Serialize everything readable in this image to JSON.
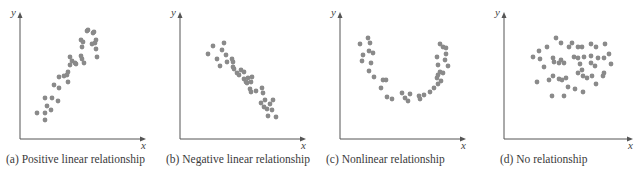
{
  "figure": {
    "panels": [
      {
        "id": "a",
        "caption": "(a) Positive linear relationship",
        "xlabel": "x",
        "ylabel": "y"
      },
      {
        "id": "b",
        "caption": "(b) Negative linear relationship",
        "xlabel": "x",
        "ylabel": "y"
      },
      {
        "id": "c",
        "caption": "(c) Nonlinear relationship",
        "xlabel": "x",
        "ylabel": "y"
      },
      {
        "id": "d",
        "caption": "(d) No relationship",
        "xlabel": "x",
        "ylabel": "y"
      }
    ],
    "colors": {
      "axis": "#555555",
      "dot": "#8a8a8a"
    }
  },
  "chart_data": [
    {
      "type": "scatter",
      "title": "(a) Positive linear relationship",
      "xlabel": "x",
      "ylabel": "y",
      "grid": false,
      "points": [
        [
          37,
          113
        ],
        [
          45,
          113
        ],
        [
          45,
          120
        ],
        [
          51,
          110
        ],
        [
          47,
          106
        ],
        [
          45,
          98
        ],
        [
          52,
          98
        ],
        [
          58,
          101
        ],
        [
          54,
          85
        ],
        [
          59,
          88
        ],
        [
          59,
          77
        ],
        [
          64,
          76
        ],
        [
          67,
          75
        ],
        [
          68,
          72
        ],
        [
          68,
          82
        ],
        [
          70,
          65
        ],
        [
          72,
          61
        ],
        [
          70,
          57
        ],
        [
          75,
          63
        ],
        [
          76,
          64
        ],
        [
          82,
          59
        ],
        [
          84,
          63
        ],
        [
          81,
          56
        ],
        [
          82,
          47
        ],
        [
          83,
          42
        ],
        [
          81,
          40
        ],
        [
          95,
          43
        ],
        [
          96,
          49
        ],
        [
          97,
          57
        ],
        [
          96,
          40
        ],
        [
          93,
          33
        ],
        [
          94,
          32
        ],
        [
          87,
          31
        ],
        [
          88,
          30
        ],
        [
          92,
          44
        ]
      ]
    },
    {
      "type": "scatter",
      "title": "(b) Negative linear relationship",
      "xlabel": "x",
      "ylabel": "y",
      "grid": false,
      "points": [
        [
          208,
          54
        ],
        [
          213,
          46
        ],
        [
          217,
          59
        ],
        [
          222,
          50
        ],
        [
          224,
          43
        ],
        [
          220,
          66
        ],
        [
          227,
          62
        ],
        [
          226,
          55
        ],
        [
          232,
          59
        ],
        [
          233,
          67
        ],
        [
          233,
          62
        ],
        [
          234,
          69
        ],
        [
          239,
          75
        ],
        [
          237,
          73
        ],
        [
          241,
          70
        ],
        [
          244,
          79
        ],
        [
          244,
          72
        ],
        [
          246,
          82
        ],
        [
          248,
          78
        ],
        [
          247,
          83
        ],
        [
          250,
          89
        ],
        [
          251,
          82
        ],
        [
          252,
          77
        ],
        [
          251,
          92
        ],
        [
          256,
          91
        ],
        [
          262,
          88
        ],
        [
          263,
          93
        ],
        [
          265,
          100
        ],
        [
          261,
          103
        ],
        [
          264,
          107
        ],
        [
          267,
          109
        ],
        [
          270,
          104
        ],
        [
          273,
          100
        ],
        [
          272,
          110
        ],
        [
          268,
          116
        ],
        [
          276,
          117
        ]
      ]
    },
    {
      "type": "scatter",
      "title": "(c) Nonlinear relationship",
      "xlabel": "x",
      "ylabel": "y",
      "grid": false,
      "points": [
        [
          360,
          44
        ],
        [
          368,
          38
        ],
        [
          370,
          43
        ],
        [
          363,
          55
        ],
        [
          369,
          51
        ],
        [
          373,
          53
        ],
        [
          362,
          61
        ],
        [
          371,
          63
        ],
        [
          369,
          71
        ],
        [
          374,
          77
        ],
        [
          383,
          80
        ],
        [
          386,
          80
        ],
        [
          381,
          88
        ],
        [
          387,
          97
        ],
        [
          392,
          99
        ],
        [
          402,
          93
        ],
        [
          405,
          98
        ],
        [
          408,
          101
        ],
        [
          410,
          94
        ],
        [
          419,
          96
        ],
        [
          420,
          99
        ],
        [
          424,
          95
        ],
        [
          430,
          92
        ],
        [
          434,
          88
        ],
        [
          438,
          84
        ],
        [
          441,
          81
        ],
        [
          437,
          78
        ],
        [
          438,
          75
        ],
        [
          440,
          72
        ],
        [
          443,
          73
        ],
        [
          445,
          60
        ],
        [
          446,
          54
        ],
        [
          438,
          65
        ],
        [
          437,
          57
        ],
        [
          443,
          47
        ],
        [
          440,
          44
        ],
        [
          446,
          48
        ],
        [
          448,
          66
        ]
      ]
    },
    {
      "type": "scatter",
      "title": "(d) No relationship",
      "xlabel": "x",
      "ylabel": "y",
      "grid": false,
      "points": [
        [
          556,
          38
        ],
        [
          539,
          51
        ],
        [
          547,
          47
        ],
        [
          561,
          43
        ],
        [
          569,
          47
        ],
        [
          572,
          43
        ],
        [
          578,
          47
        ],
        [
          582,
          47
        ],
        [
          591,
          44
        ],
        [
          596,
          47
        ],
        [
          605,
          44
        ],
        [
          609,
          54
        ],
        [
          604,
          73
        ],
        [
          611,
          64
        ],
        [
          604,
          58
        ],
        [
          533,
          57
        ],
        [
          540,
          59
        ],
        [
          553,
          58
        ],
        [
          559,
          63
        ],
        [
          544,
          67
        ],
        [
          554,
          62
        ],
        [
          561,
          60
        ],
        [
          564,
          63
        ],
        [
          574,
          57
        ],
        [
          578,
          58
        ],
        [
          584,
          57
        ],
        [
          580,
          64
        ],
        [
          591,
          56
        ],
        [
          591,
          63
        ],
        [
          598,
          58
        ],
        [
          595,
          66
        ],
        [
          537,
          82
        ],
        [
          549,
          80
        ],
        [
          553,
          76
        ],
        [
          559,
          79
        ],
        [
          562,
          80
        ],
        [
          566,
          78
        ],
        [
          578,
          73
        ],
        [
          583,
          76
        ],
        [
          587,
          78
        ],
        [
          592,
          76
        ],
        [
          575,
          89
        ],
        [
          583,
          92
        ],
        [
          552,
          96
        ],
        [
          564,
          96
        ],
        [
          568,
          87
        ],
        [
          582,
          70
        ],
        [
          596,
          84
        ],
        [
          603,
          76
        ]
      ]
    }
  ]
}
